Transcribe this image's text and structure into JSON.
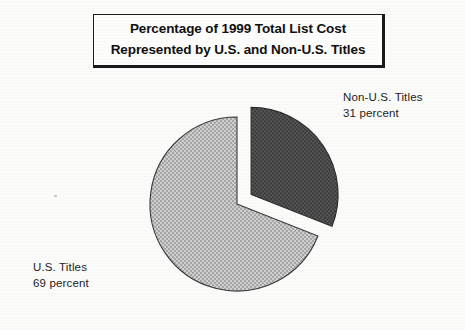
{
  "title": {
    "line1": "Percentage of 1999 Total List Cost",
    "line2": "Represented by U.S. and Non-U.S. Titles"
  },
  "labels": {
    "nonus_name": "Non-U.S. Titles",
    "nonus_value": "31 percent",
    "us_name": "U.S. Titles",
    "us_value": "69 percent"
  },
  "colors": {
    "slice_us": "#b8b8b8",
    "slice_nonus": "#4a4a4a",
    "outline": "#2b2b2b",
    "text": "#1d1d1d",
    "background": "#fbfbf9"
  },
  "chart_data": {
    "type": "pie",
    "title": "Percentage of 1999 Total List Cost Represented by U.S. and Non-U.S. Titles",
    "categories": [
      "U.S. Titles",
      "Non-U.S. Titles"
    ],
    "values": [
      69,
      31
    ],
    "unit": "percent",
    "labels": [
      "U.S. Titles 69 percent",
      "Non-U.S. Titles 31 percent"
    ],
    "colors": [
      "#b8b8b8",
      "#4a4a4a"
    ],
    "exploded": [
      "Non-U.S. Titles"
    ],
    "start_angle_deg": 0,
    "direction": "clockwise",
    "legend": "none",
    "data_labels_position": "outside-callout"
  }
}
